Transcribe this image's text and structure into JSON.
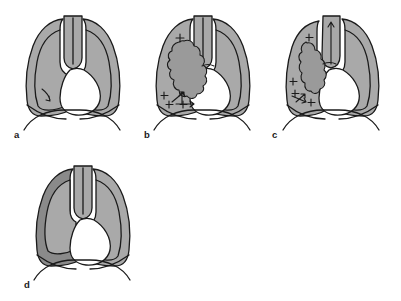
{
  "figure": {
    "background_color": "#ffffff",
    "outline_color": "#1a1a1a",
    "lung_fill_color": "#a9a9a9",
    "lung_fill_dark_color": "#8a8a8a",
    "mass_fill_color": "#9a9a9a",
    "cavity_fill_color": "#ffffff",
    "panel_count": 4
  },
  "panels": [
    {
      "id": "a",
      "label": "a",
      "description": "Normal chest outline with both lungs aerated, central trachea, small marker in left lower lung",
      "left_lung_shade": "normal",
      "right_lung_shade": "normal",
      "mediastinum_shift": "none",
      "trachea_position": "midline",
      "has_mass": false,
      "plus_marks": 0,
      "arrows": [
        {
          "name": "lesion-pointer-arrow",
          "direction": "down-left"
        }
      ]
    },
    {
      "id": "b",
      "label": "b",
      "description": "Lobulated hilar mass in left lung with surrounding plus signs and arrow showing direction of shift",
      "left_lung_shade": "normal",
      "right_lung_shade": "normal",
      "mediastinum_shift": "none",
      "trachea_position": "midline",
      "has_mass": true,
      "mass_shape": "lobulated-cloud",
      "plus_marks": 4,
      "arrows": [
        {
          "name": "shift-arrow-right",
          "direction": "right"
        },
        {
          "name": "mass-pointer-arrow",
          "direction": "up-right"
        },
        {
          "name": "mass-pointer-arrow-2",
          "direction": "up"
        }
      ]
    },
    {
      "id": "c",
      "label": "c",
      "description": "Lobulated mass with volume loss; trachea and mediastinum pulled toward the affected side, arrow in trachea pointing up",
      "left_lung_shade": "normal",
      "right_lung_shade": "normal",
      "mediastinum_shift": "toward-lesion",
      "trachea_position": "deviated",
      "has_mass": true,
      "mass_shape": "lobulated-narrow",
      "plus_marks": 4,
      "arrows": [
        {
          "name": "trachea-arrow-up",
          "direction": "up"
        },
        {
          "name": "volume-loss-arrow",
          "direction": "left-down"
        }
      ]
    },
    {
      "id": "d",
      "label": "d",
      "description": "Dense opacification of the left hemithorax shown as darker shading with preserved chest outline",
      "left_lung_shade": "dark",
      "right_lung_shade": "normal",
      "mediastinum_shift": "none",
      "trachea_position": "midline",
      "has_mass": false,
      "plus_marks": 0,
      "arrows": []
    }
  ],
  "labels": {
    "a": "a",
    "b": "b",
    "c": "c",
    "d": "d"
  }
}
